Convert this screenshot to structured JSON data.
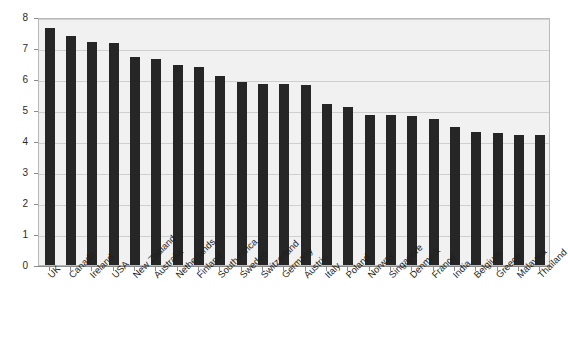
{
  "chart_data": {
    "type": "bar",
    "title": "",
    "subtitle": "",
    "xlabel": "",
    "ylabel": "",
    "ylim": [
      0,
      8
    ],
    "y_ticks": [
      0,
      1,
      2,
      3,
      4,
      5,
      6,
      7,
      8
    ],
    "grid": true,
    "legend": null,
    "bar_color": "#262626",
    "plot_background": "#f1f1f1",
    "gridline_color": "#cfcfcf",
    "categories": [
      "UK",
      "Canada",
      "Ireland",
      "USA",
      "New Zealand",
      "Australia",
      "Netherlands",
      "Finland",
      "South Africa",
      "Sweden",
      "Switzerland",
      "Germany",
      "Austria",
      "Italy",
      "Poland",
      "Norway",
      "Singapore",
      "Denmark",
      "France",
      "India",
      "Belgium",
      "Greece",
      "Malaysia",
      "Thailand"
    ],
    "values": [
      7.65,
      7.4,
      7.2,
      7.15,
      6.7,
      6.65,
      6.45,
      6.4,
      6.1,
      5.9,
      5.85,
      5.85,
      5.8,
      5.2,
      5.1,
      4.85,
      4.85,
      4.8,
      4.7,
      4.45,
      4.3,
      4.25,
      4.2,
      4.2
    ]
  }
}
